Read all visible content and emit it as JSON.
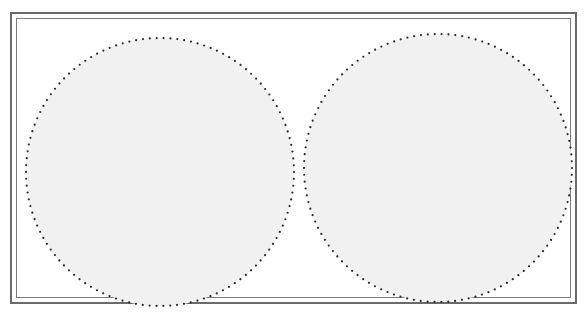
{
  "page": {
    "colors": {
      "background": "#ffffff",
      "frame": "#6a6a6a",
      "circle_fill": "#f1f1f1",
      "dot": "#2a2a2a"
    },
    "circles": [
      {
        "id": "left",
        "cx": 160,
        "cy": 172,
        "r": 134
      },
      {
        "id": "right",
        "cx": 438,
        "cy": 168,
        "r": 134
      }
    ]
  }
}
